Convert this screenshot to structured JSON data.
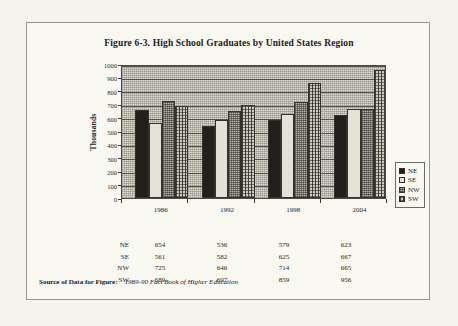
{
  "figure": {
    "title": "Figure 6-3. High School Graduates by United States Region",
    "source_label": "Source of Data for Figure:",
    "source_reference": "1989-90 Fact Book of Higher Education"
  },
  "chart_data": {
    "type": "bar",
    "title": "Figure 6-3. High School Graduates by United States Region",
    "xlabel": "",
    "ylabel": "Thousands",
    "ylim": [
      0,
      1000
    ],
    "ytick_step": 100,
    "yticks": [
      0,
      100,
      200,
      300,
      400,
      500,
      600,
      700,
      800,
      900,
      1000
    ],
    "grid": true,
    "legend_position": "right",
    "categories": [
      "1986",
      "1992",
      "1998",
      "2004"
    ],
    "series": [
      {
        "name": "NE",
        "values": [
          654,
          536,
          579,
          623
        ],
        "pattern": "solid-black",
        "color": "#231f1a"
      },
      {
        "name": "SE",
        "values": [
          561,
          582,
          625,
          667
        ],
        "pattern": "light-plain",
        "color": "#e6e4d8"
      },
      {
        "name": "NW",
        "values": [
          725,
          646,
          714,
          665
        ],
        "pattern": "fine-dotted-gray",
        "color": "#b9b7a9"
      },
      {
        "name": "SW",
        "values": [
          689,
          697,
          859,
          956
        ],
        "pattern": "vertical-crosshatch",
        "color": "#cfcdc0"
      }
    ]
  },
  "table": {
    "rows": [
      {
        "series": "NE",
        "values": [
          "654",
          "536",
          "579",
          "623"
        ]
      },
      {
        "series": "SE",
        "values": [
          "561",
          "582",
          "625",
          "667"
        ]
      },
      {
        "series": "NW",
        "values": [
          "725",
          "646",
          "714",
          "665"
        ]
      },
      {
        "series": "SW",
        "values": [
          "689",
          "697",
          "859",
          "956"
        ]
      }
    ]
  }
}
